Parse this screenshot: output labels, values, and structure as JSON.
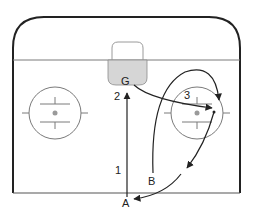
{
  "diagram": {
    "colors": {
      "boards": "#222222",
      "lines": "#7a7a7a",
      "crease_fill": "#d6d6d6",
      "net": "#9a9a9a",
      "paths": "#222222",
      "faceoff_dot": "#9a9a9a"
    },
    "labels": {
      "goalie": "G",
      "player_a": "A",
      "player_b": "B",
      "step_1": "1",
      "step_2": "2",
      "step_3": "3"
    }
  }
}
